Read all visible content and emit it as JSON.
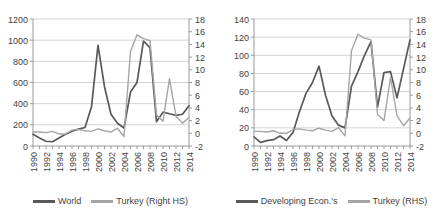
{
  "figure": {
    "panels": [
      {
        "id": "panel-world",
        "chart_data": {
          "type": "line",
          "title": "",
          "subtitle": "",
          "xlabel": "",
          "ylabel": "",
          "y2label": "",
          "grid": true,
          "legend_position": "bottom",
          "x": [
            1990,
            1991,
            1992,
            1993,
            1994,
            1995,
            1996,
            1997,
            1998,
            1999,
            2000,
            2001,
            2002,
            2003,
            2004,
            2005,
            2006,
            2007,
            2008,
            2009,
            2010,
            2011,
            2012,
            2013,
            2014
          ],
          "xtick_labels": [
            "1990",
            "1992",
            "1994",
            "1996",
            "1998",
            "2000",
            "2002",
            "2004",
            "2006",
            "2008",
            "2010",
            "2012",
            "2014"
          ],
          "ylim": [
            0,
            1200
          ],
          "ytick_labels": [
            "0",
            "200",
            "400",
            "600",
            "800",
            "1000",
            "1200"
          ],
          "y2lim": [
            -2,
            18
          ],
          "y2tick_labels": [
            "-2",
            "0",
            "2",
            "4",
            "6",
            "8",
            "10",
            "12",
            "14",
            "16",
            "18"
          ],
          "series": [
            {
              "name": "World",
              "axis": "left",
              "color": "#595959",
              "values": [
                110,
                75,
                45,
                40,
                75,
                110,
                140,
                160,
                175,
                370,
                950,
                560,
                300,
                215,
                170,
                510,
                600,
                990,
                930,
                230,
                320,
                305,
                290,
                300,
                380
              ]
            },
            {
              "name": "Turkey (Right HS)",
              "axis": "right",
              "color": "#a6a6a6",
              "values": [
                0.2,
                0.2,
                0.1,
                0.3,
                -0.1,
                -0.1,
                0.5,
                0.6,
                0.4,
                0.3,
                0.7,
                0.4,
                0.2,
                0.8,
                -0.5,
                12.9,
                15.5,
                14.9,
                14.6,
                2.9,
                1.9,
                8.6,
                2.7,
                1.6,
                2.5
              ]
            }
          ]
        },
        "legend": [
          {
            "label": "World",
            "color": "#595959"
          },
          {
            "label": "Turkey (Right HS)",
            "color": "#a6a6a6"
          }
        ]
      },
      {
        "id": "panel-developing",
        "chart_data": {
          "type": "line",
          "title": "",
          "subtitle": "",
          "xlabel": "",
          "ylabel": "",
          "y2label": "",
          "grid": true,
          "legend_position": "bottom",
          "x": [
            1990,
            1991,
            1992,
            1993,
            1994,
            1995,
            1996,
            1997,
            1998,
            1999,
            2000,
            2001,
            2002,
            2003,
            2004,
            2005,
            2006,
            2007,
            2008,
            2009,
            2010,
            2011,
            2012,
            2013,
            2014
          ],
          "xtick_labels": [
            "1990",
            "1992",
            "1994",
            "1996",
            "1998",
            "2000",
            "2002",
            "2004",
            "2006",
            "2008",
            "2010",
            "2012",
            "2014"
          ],
          "ylim": [
            0,
            140
          ],
          "ytick_labels": [
            "0",
            "20",
            "40",
            "60",
            "80",
            "100",
            "120",
            "140"
          ],
          "y2lim": [
            -2,
            18
          ],
          "y2tick_labels": [
            "-2",
            "0",
            "2",
            "4",
            "6",
            "8",
            "10",
            "12",
            "14",
            "16",
            "18"
          ],
          "series": [
            {
              "name": "Developing Econ.'s",
              "axis": "left",
              "color": "#595959",
              "values": [
                10,
                4,
                6,
                7,
                11,
                6,
                15,
                38,
                58,
                70,
                88,
                56,
                33,
                23,
                20,
                66,
                82,
                100,
                115,
                43,
                81,
                82,
                53,
                85,
                117
              ]
            },
            {
              "name": "Turkey (RHS)",
              "axis": "right",
              "color": "#a6a6a6",
              "values": [
                0.3,
                0.3,
                0.2,
                0.4,
                0.0,
                0.0,
                0.6,
                0.7,
                0.5,
                0.4,
                0.8,
                0.5,
                0.3,
                0.9,
                -0.4,
                13.0,
                15.6,
                15.0,
                14.7,
                3.0,
                2.0,
                8.8,
                2.8,
                1.2,
                2.4
              ]
            }
          ]
        },
        "legend": [
          {
            "label": "Developing Econ.'s",
            "color": "#595959"
          },
          {
            "label": "Turkey (RHS)",
            "color": "#a6a6a6"
          }
        ]
      }
    ]
  },
  "colors": {
    "primary_line": "#595959",
    "secondary_line": "#a6a6a6",
    "grid": "#d4d4d4",
    "axis": "#9a9a9a",
    "text": "#3f3f3f"
  }
}
